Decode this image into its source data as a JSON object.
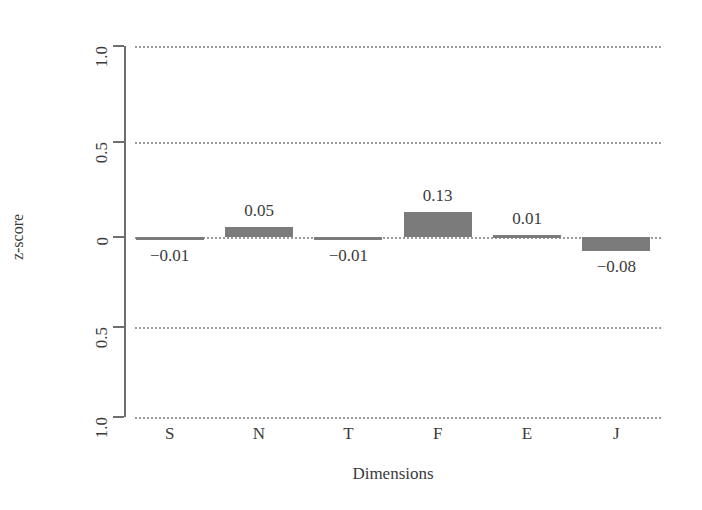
{
  "chart_data": {
    "type": "bar",
    "title": "",
    "xlabel": "Dimensions",
    "ylabel": "z-score",
    "categories": [
      "S",
      "N",
      "T",
      "F",
      "E",
      "J"
    ],
    "values": [
      -0.01,
      0.05,
      -0.01,
      0.13,
      0.01,
      -0.08
    ],
    "value_labels": [
      "−0.01",
      "0.05",
      "−0.01",
      "0.13",
      "0.01",
      "−0.08"
    ],
    "ylim": [
      -1.0,
      1.0
    ],
    "yticks": [
      1.0,
      0.5,
      0,
      -0.5,
      -1.0
    ],
    "ytick_labels": [
      "1.0",
      "0.5",
      "0",
      "0.5",
      "1.0"
    ],
    "grid": "horizontal-dotted",
    "legend": "none",
    "bar_color": "#7b7b7b",
    "axis_color": "#6e6e6e",
    "grid_color": "#9a9a9a",
    "text_color": "#3a3a3a",
    "background": "#ffffff"
  }
}
